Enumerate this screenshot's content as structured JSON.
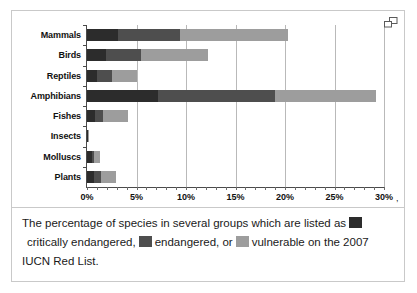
{
  "chart_data": {
    "type": "bar",
    "orientation": "horizontal",
    "stacked": true,
    "title": "",
    "xlabel": "",
    "ylabel": "",
    "xlim": [
      0,
      30
    ],
    "xunit": "%",
    "grid": true,
    "legend_position": "caption",
    "categories": [
      "Mammals",
      "Birds",
      "Reptiles",
      "Amphibians",
      "Fishes",
      "Insects",
      "Molluscs",
      "Plants"
    ],
    "series": [
      {
        "name": "critically endangered",
        "color": "#2c2c2c",
        "values": [
          3.1,
          1.9,
          1.0,
          7.2,
          0.8,
          0.05,
          0.5,
          0.7
        ]
      },
      {
        "name": "endangered",
        "color": "#4e4e4e",
        "values": [
          6.3,
          3.6,
          1.5,
          11.8,
          0.8,
          0.03,
          0.2,
          0.7
        ]
      },
      {
        "name": "vulnerable",
        "color": "#9d9d9d",
        "values": [
          10.9,
          6.7,
          2.6,
          10.2,
          2.5,
          0.02,
          0.6,
          1.5
        ]
      }
    ],
    "totals": [
      20.3,
      12.2,
      5.1,
      29.2,
      4.1,
      0.1,
      1.3,
      2.9
    ],
    "xticks": [
      {
        "value": 0,
        "label": "0%"
      },
      {
        "value": 5,
        "label": "5%"
      },
      {
        "value": 10,
        "label": "10%"
      },
      {
        "value": 15,
        "label": "15%"
      },
      {
        "value": 20,
        "label": "20%"
      },
      {
        "value": 25,
        "label": "25%"
      },
      {
        "value": 30,
        "label": "30%"
      }
    ],
    "axis_tail_label": ","
  },
  "caption": {
    "line1_before": "The percentage of species in several groups which are listed as",
    "line2_before": "critically endangered,",
    "line2_middle": "endangered, or",
    "line2_after": "vulnerable on the 2007",
    "line3": "IUCN Red List."
  },
  "colors": {
    "critically_endangered": "#2c2c2c",
    "endangered": "#4e4e4e",
    "vulnerable": "#9d9d9d",
    "gridline": "#b9b9b9",
    "axis": "#4a4a4a",
    "frame_border": "#c9c9c9"
  }
}
